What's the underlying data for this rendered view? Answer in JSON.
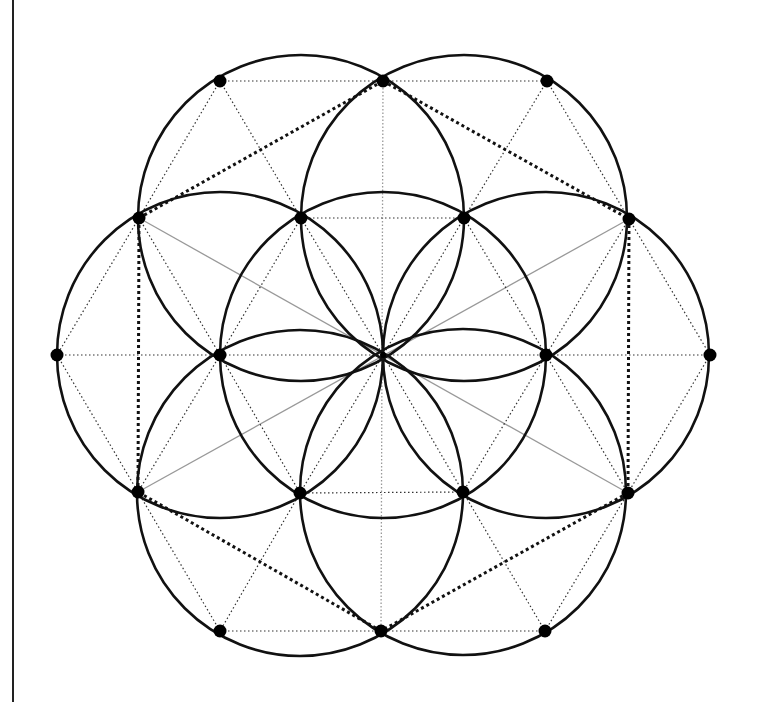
{
  "diagram": {
    "colors": {
      "circle": "#111111",
      "point": "#000000",
      "hexagon_dotted": "#111111",
      "thin_dotted": "#333333",
      "axis_gray": "#999999",
      "frame": "#222222"
    },
    "circle_radius": 163,
    "center": [
      383,
      355
    ],
    "circle_centers": [
      [
        383,
        355
      ],
      [
        301,
        218
      ],
      [
        464,
        218
      ],
      [
        546,
        355
      ],
      [
        463,
        492
      ],
      [
        300,
        493
      ],
      [
        220,
        355
      ]
    ],
    "points": [
      [
        383,
        355
      ],
      [
        301,
        218
      ],
      [
        464,
        218
      ],
      [
        546,
        355
      ],
      [
        463,
        492
      ],
      [
        300,
        493
      ],
      [
        220,
        355
      ],
      [
        383,
        81
      ],
      [
        547,
        81
      ],
      [
        629,
        219
      ],
      [
        710,
        355
      ],
      [
        628,
        493
      ],
      [
        545,
        631
      ],
      [
        381,
        631
      ],
      [
        220,
        631
      ],
      [
        138,
        492
      ],
      [
        57,
        355
      ],
      [
        139,
        218
      ],
      [
        220,
        81
      ]
    ],
    "hexagon_thick_dotted": [
      [
        [
          139,
          218
        ],
        [
          383,
          81
        ]
      ],
      [
        [
          383,
          81
        ],
        [
          629,
          219
        ]
      ],
      [
        [
          629,
          219
        ],
        [
          628,
          493
        ]
      ],
      [
        [
          628,
          493
        ],
        [
          381,
          631
        ]
      ],
      [
        [
          381,
          631
        ],
        [
          138,
          492
        ]
      ],
      [
        [
          138,
          492
        ],
        [
          139,
          218
        ]
      ]
    ],
    "thin_dotted": [
      [
        [
          220,
          81
        ],
        [
          547,
          81
        ]
      ],
      [
        [
          301,
          218
        ],
        [
          464,
          218
        ]
      ],
      [
        [
          57,
          355
        ],
        [
          710,
          355
        ]
      ],
      [
        [
          300,
          493
        ],
        [
          463,
          492
        ]
      ],
      [
        [
          220,
          631
        ],
        [
          545,
          631
        ]
      ],
      [
        [
          220,
          81
        ],
        [
          139,
          218
        ]
      ],
      [
        [
          220,
          81
        ],
        [
          301,
          218
        ]
      ],
      [
        [
          547,
          81
        ],
        [
          629,
          219
        ]
      ],
      [
        [
          547,
          81
        ],
        [
          464,
          218
        ]
      ],
      [
        [
          139,
          218
        ],
        [
          57,
          355
        ]
      ],
      [
        [
          139,
          218
        ],
        [
          220,
          355
        ]
      ],
      [
        [
          629,
          219
        ],
        [
          710,
          355
        ]
      ],
      [
        [
          629,
          219
        ],
        [
          546,
          355
        ]
      ],
      [
        [
          57,
          355
        ],
        [
          138,
          492
        ]
      ],
      [
        [
          220,
          355
        ],
        [
          138,
          492
        ]
      ],
      [
        [
          710,
          355
        ],
        [
          628,
          493
        ]
      ],
      [
        [
          546,
          355
        ],
        [
          628,
          493
        ]
      ],
      [
        [
          138,
          492
        ],
        [
          220,
          631
        ]
      ],
      [
        [
          300,
          493
        ],
        [
          220,
          631
        ]
      ],
      [
        [
          628,
          493
        ],
        [
          545,
          631
        ]
      ],
      [
        [
          463,
          492
        ],
        [
          545,
          631
        ]
      ],
      [
        [
          301,
          218
        ],
        [
          220,
          355
        ]
      ],
      [
        [
          301,
          218
        ],
        [
          383,
          355
        ]
      ],
      [
        [
          464,
          218
        ],
        [
          546,
          355
        ]
      ],
      [
        [
          464,
          218
        ],
        [
          383,
          355
        ]
      ],
      [
        [
          220,
          355
        ],
        [
          300,
          493
        ]
      ],
      [
        [
          383,
          355
        ],
        [
          300,
          493
        ]
      ],
      [
        [
          546,
          355
        ],
        [
          463,
          492
        ]
      ],
      [
        [
          383,
          355
        ],
        [
          463,
          492
        ]
      ]
    ],
    "gray_solid": [
      [
        [
          139,
          218
        ],
        [
          628,
          493
        ]
      ],
      [
        [
          629,
          219
        ],
        [
          138,
          492
        ]
      ]
    ],
    "gray_dotted": [
      [
        [
          383,
          81
        ],
        [
          381,
          631
        ]
      ]
    ]
  }
}
